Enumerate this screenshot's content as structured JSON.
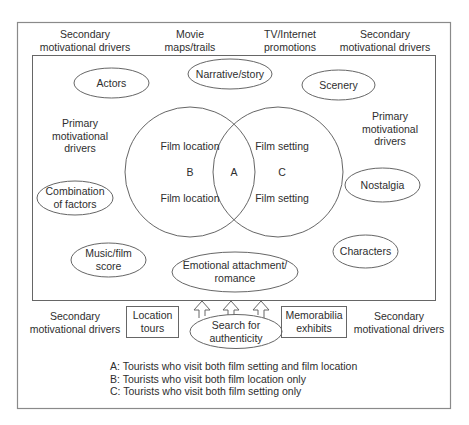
{
  "diagram": {
    "type": "film-tourism-motivation-model",
    "colors": {
      "stroke": "#555555",
      "text": "#2e2e2e",
      "background": "#ffffff"
    },
    "top_labels": [
      {
        "id": "secondary-top-left",
        "line1": "Secondary",
        "line2": "motivational drivers"
      },
      {
        "id": "movie-maps",
        "line1": "Movie",
        "line2": "maps/trails"
      },
      {
        "id": "tv-internet",
        "line1": "TV/Internet",
        "line2": "promotions"
      },
      {
        "id": "secondary-top-right",
        "line1": "Secondary",
        "line2": "motivational drivers"
      }
    ],
    "primary_labels": {
      "left": {
        "line1": "Primary",
        "line2": "motivational",
        "line3": "drivers"
      },
      "right": {
        "line1": "Primary",
        "line2": "motivational",
        "line3": "drivers"
      }
    },
    "ellipses": {
      "actors": "Actors",
      "narrative": "Narrative/story",
      "scenery": "Scenery",
      "combination": {
        "line1": "Combination",
        "line2": "of factors"
      },
      "nostalgia": "Nostalgia",
      "music": {
        "line1": "Music/film",
        "line2": "score"
      },
      "characters": "Characters",
      "emotional": {
        "line1": "Emotional attachment/",
        "line2": "romance"
      },
      "search": {
        "line1": "Search for",
        "line2": "authenticity"
      }
    },
    "venn": {
      "left": {
        "top": "Film location",
        "letter": "B",
        "bottom": "Film location"
      },
      "overlap": {
        "letter": "A"
      },
      "right": {
        "top": "Film setting",
        "letter": "C",
        "bottom": "Film setting"
      }
    },
    "bottom_labels": {
      "secondary_left": {
        "line1": "Secondary",
        "line2": "motivational drivers"
      },
      "location_tours": {
        "line1": "Location",
        "line2": "tours"
      },
      "memorabilia": {
        "line1": "Memorabilia",
        "line2": "exhibits"
      },
      "secondary_right": {
        "line1": "Secondary",
        "line2": "motivational drivers"
      }
    },
    "arrows_count": 3,
    "legend": [
      "A: Tourists who visit both film setting and film location",
      "B: Tourists who visit both film location only",
      "C: Tourists who visit both film setting only"
    ]
  }
}
